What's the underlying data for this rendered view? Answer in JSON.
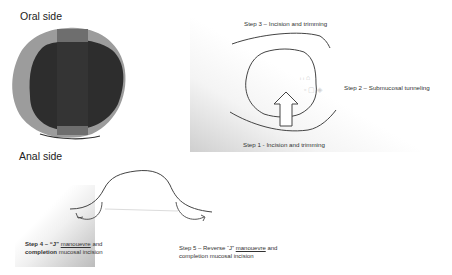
{
  "oral_panel": {
    "heading": "Oral side"
  },
  "steps_panel": {
    "step3": "Step 3 – Incision and trimming",
    "step2": "Step 2 – Submucosal tunneling",
    "step1": "Step 1 - Incision and trimming"
  },
  "anal_panel": {
    "heading": "Anal side",
    "step4": {
      "prefix": "Step 4 – “J” ",
      "underlined": "manouevre",
      "suffix": " and",
      "line2_bold": "completion",
      "line2_rest": " mucosal incision"
    },
    "step5": {
      "prefix": "Step 5 – Reverse “J” ",
      "underlined": "manouevre",
      "suffix": " and",
      "line2": "completion mucosal incision"
    }
  },
  "colors": {
    "outer_ring": "#9a9a9a",
    "lesion_dark": "#2b2b2b",
    "band": "#5f5f5f",
    "line": "#444444"
  }
}
